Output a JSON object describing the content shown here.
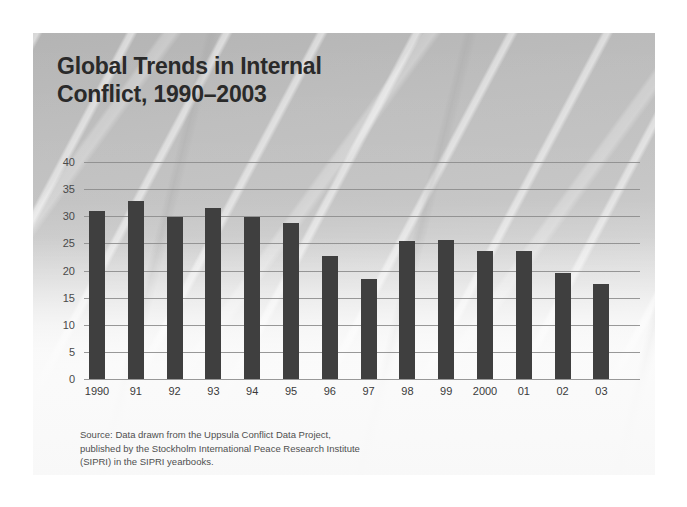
{
  "slide": {
    "title_line_1": "Global Trends in Internal",
    "title_line_2": "Conflict, 1990–2003",
    "source_line_1": "Source: Data drawn from the Uppsula Conflict Data Project,",
    "source_line_2": "published by the Stockholm International Peace Research Institute",
    "source_line_3": "(SIPRI) in the SIPRI yearbooks."
  },
  "colors": {
    "bar": "#3f3f3f",
    "gridline": "#8d8d8d",
    "title_text": "#2a2a2a",
    "axis_text": "#3a3a3a",
    "source_text": "#4f4f4f",
    "card_background": "#c8c8c8",
    "page_background": "#ffffff"
  },
  "chart_data": {
    "type": "bar",
    "title": "Global Trends in Internal Conflict, 1990–2003",
    "xlabel": "",
    "ylabel": "",
    "categories": [
      "1990",
      "91",
      "92",
      "93",
      "94",
      "95",
      "96",
      "97",
      "98",
      "99",
      "2000",
      "01",
      "02",
      "03"
    ],
    "values": [
      31,
      32.8,
      29.8,
      31.5,
      29.8,
      28.7,
      22.7,
      18.4,
      25.5,
      25.6,
      23.6,
      23.6,
      19.5,
      17.5
    ],
    "ylim": [
      0,
      40
    ],
    "yticks": [
      0,
      5,
      10,
      15,
      20,
      25,
      30,
      35,
      40
    ],
    "ytick_labels": [
      "0",
      "5",
      "10",
      "15",
      "20",
      "25",
      "30",
      "35",
      "40"
    ],
    "grid": true,
    "legend": false,
    "annotations": [
      "Source: Data drawn from the Uppsula Conflict Data Project, published by the Stockholm International Peace Research Institute (SIPRI) in the SIPRI yearbooks."
    ]
  }
}
